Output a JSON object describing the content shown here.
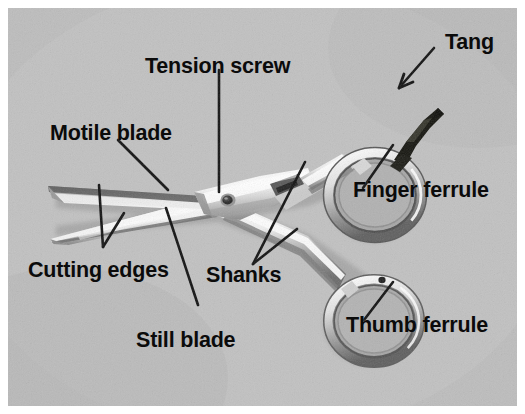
{
  "figure": {
    "kind": "labeled-photo-diagram",
    "background_color": "#b9b9b9",
    "border_color": "#ffffff",
    "label_color": "#0b0b0b",
    "leader_color": "#111111"
  },
  "labels": {
    "tang": "Tang",
    "tension_screw": "Tension screw",
    "motile_blade": "Motile blade",
    "finger_ferrule": "Finger ferrule",
    "cutting_edges": "Cutting edges",
    "shanks": "Shanks",
    "thumb_ferrule": "Thumb ferrule",
    "still_blade": "Still blade"
  },
  "parts": [
    {
      "id": "tang",
      "label": "Tang",
      "label_x": 437,
      "label_y": 24,
      "leader": "arrow",
      "points": [
        [
          434,
          48
        ],
        [
          399,
          88
        ]
      ]
    },
    {
      "id": "tension-screw",
      "label": "Tension screw",
      "label_x": 137,
      "label_y": 48,
      "leader": "line",
      "points": [
        [
          219,
          70
        ],
        [
          219,
          192
        ]
      ]
    },
    {
      "id": "motile-blade",
      "label": "Motile blade",
      "label_x": 42,
      "label_y": 115,
      "leader": "line",
      "points": [
        [
          118,
          140
        ],
        [
          168,
          190
        ]
      ]
    },
    {
      "id": "finger-ferrule",
      "label": "Finger ferrule",
      "label_x": 345,
      "label_y": 172,
      "leader": "line",
      "points": [
        [
          393,
          145
        ],
        [
          363,
          188
        ]
      ]
    },
    {
      "id": "cutting-edges",
      "label": "Cutting edges",
      "label_x": 20,
      "label_y": 252,
      "leader": "vee",
      "points": [
        [
          103,
          247
        ],
        [
          99,
          185
        ],
        [
          124,
          213
        ]
      ]
    },
    {
      "id": "shanks",
      "label": "Shanks",
      "label_x": 198,
      "label_y": 257,
      "leader": "vee",
      "points": [
        [
          253,
          264
        ],
        [
          305,
          162
        ],
        [
          297,
          229
        ]
      ]
    },
    {
      "id": "thumb-ferrule",
      "label": "Thumb ferrule",
      "label_x": 338,
      "label_y": 307,
      "leader": "line",
      "points": [
        [
          393,
          282
        ],
        [
          364,
          320
        ]
      ]
    },
    {
      "id": "still-blade",
      "label": "Still blade",
      "label_x": 128,
      "label_y": 322,
      "leader": "line",
      "points": [
        [
          166,
          208
        ],
        [
          198,
          305
        ]
      ]
    }
  ]
}
